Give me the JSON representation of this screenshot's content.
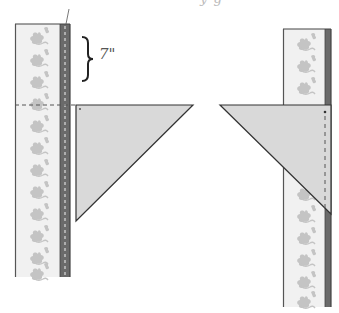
{
  "figure": {
    "type": "quilting-binding-miter-diagram",
    "top_text_fragment": "y                  g",
    "measurement_label": "7\"",
    "colors": {
      "strip_fill": "#f1f1f1",
      "strip_border": "#555555",
      "motif": "#c4c4c4",
      "dark_band": "#6a6a6a",
      "triangle_fill": "#d9d9d9",
      "triangle_stroke": "#333333",
      "dashed_line": "#555555"
    },
    "left_panel": {
      "strip": {
        "x": 15,
        "y": 24,
        "width": 55,
        "height": 253
      },
      "dark_band": {
        "x": 60,
        "width": 10
      },
      "fold_line_y": 105,
      "triangle": {
        "points": [
          [
            76,
            105
          ],
          [
            193,
            105
          ],
          [
            76,
            221
          ]
        ]
      },
      "brace": {
        "x": 82,
        "y_top": 37,
        "y_bottom": 82
      }
    },
    "right_panel": {
      "strip": {
        "x": 283,
        "y": 29,
        "width": 48,
        "height": 278
      },
      "dark_band": {
        "x": 325,
        "width": 6
      },
      "triangle": {
        "points": [
          [
            220,
            105
          ],
          [
            331,
            105
          ],
          [
            331,
            214
          ]
        ]
      },
      "stitch_line_x": 325
    }
  }
}
